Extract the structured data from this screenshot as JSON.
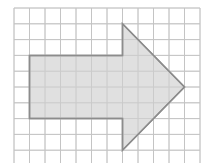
{
  "diagram": {
    "grid": {
      "columns": 12,
      "rows": 10,
      "origin_x": 14,
      "origin_y": 8,
      "cell_w": 15.5,
      "cell_h": 15.8,
      "line_color": "#c4c4c4"
    },
    "shape": {
      "name": "right-pointing arrow",
      "fill": "#dadada",
      "stroke": "#8c8c8c",
      "vertices_grid": [
        [
          1,
          3
        ],
        [
          7,
          3
        ],
        [
          7,
          1
        ],
        [
          11,
          5
        ],
        [
          7,
          9
        ],
        [
          7,
          7
        ],
        [
          1,
          7
        ]
      ]
    }
  }
}
